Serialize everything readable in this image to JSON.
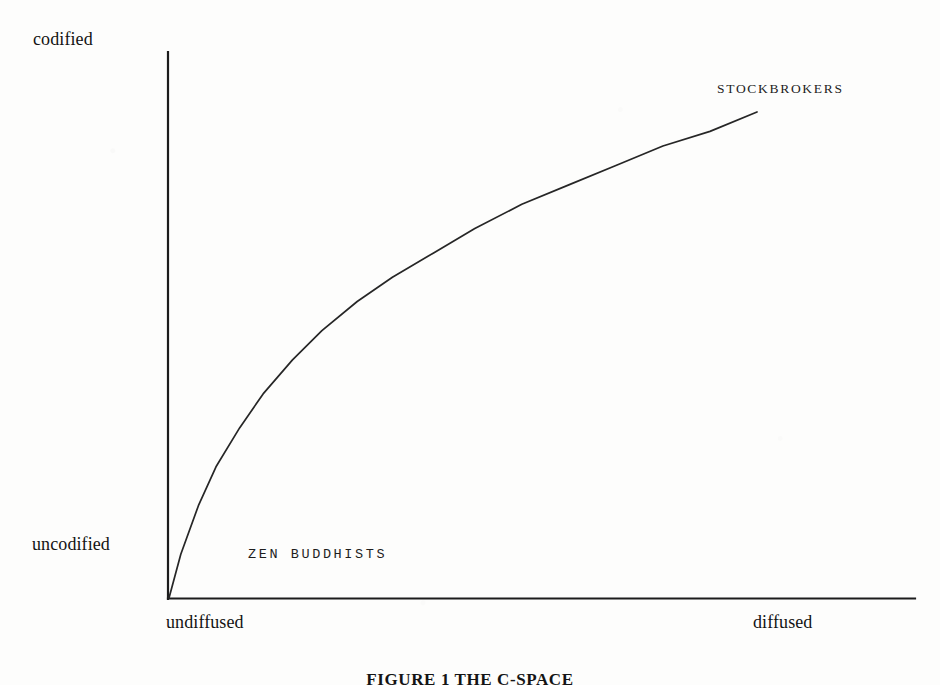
{
  "chart_data": {
    "type": "line",
    "title": "FIGURE 1  THE C-SPACE",
    "xlabel": "",
    "ylabel": "",
    "grid": false,
    "legend": "none",
    "axes": {
      "x": {
        "min_tick_label": "undiffused",
        "max_tick_label": "diffused",
        "range": [
          0,
          1
        ]
      },
      "y": {
        "min_tick_label": "uncodified",
        "max_tick_label": "codified",
        "range": [
          0,
          1
        ]
      }
    },
    "series": [
      {
        "name": "codification-diffusion curve",
        "x": [
          0.0,
          0.02,
          0.05,
          0.08,
          0.12,
          0.16,
          0.21,
          0.26,
          0.32,
          0.38,
          0.45,
          0.52,
          0.6,
          0.68,
          0.76,
          0.84,
          0.92,
          1.0
        ],
        "y": [
          0.0,
          0.09,
          0.19,
          0.27,
          0.35,
          0.42,
          0.49,
          0.55,
          0.61,
          0.66,
          0.71,
          0.76,
          0.81,
          0.85,
          0.89,
          0.93,
          0.96,
          1.0
        ]
      }
    ],
    "annotations": [
      {
        "text": "STOCKBROKERS",
        "x": 0.92,
        "y": 1.04,
        "region": "upper-right"
      },
      {
        "text": "ZEN BUDDHISTS",
        "x": 0.14,
        "y": 0.09,
        "region": "lower-left"
      }
    ]
  },
  "labels": {
    "codified": "codified",
    "uncodified": "uncodified",
    "undiffused": "undiffused",
    "diffused": "diffused",
    "stockbrokers": "STOCKBROKERS",
    "zen_buddhists": "ZEN BUDDHISTS"
  },
  "caption": {
    "text": "FIGURE 1  THE C-SPACE"
  },
  "colors": {
    "ink": "#1a1a1a",
    "axis": "#1c1c1c",
    "curve": "#262626",
    "paper": "#fdfdfc"
  }
}
